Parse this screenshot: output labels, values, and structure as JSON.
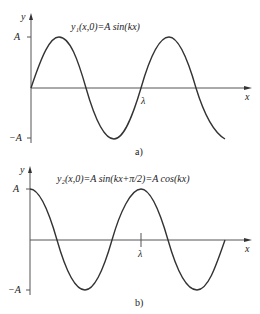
{
  "figure_a": {
    "equation": "y₁(x,0)=A sin(kx)",
    "y_axis_label": "y",
    "x_axis_label": "x",
    "tick_A": "A",
    "tick_negA": "−A",
    "lambda_label": "λ",
    "panel_label": "a)"
  },
  "figure_b": {
    "equation": "y₂(x,0)=A sin(kx+π/2)=A cos(kx)",
    "y_axis_label": "y",
    "x_axis_label": "x",
    "tick_A": "A",
    "tick_negA": "−A",
    "lambda_label": "λ",
    "panel_label": "b)"
  },
  "colors": {
    "stroke": "#333333",
    "axis": "#555555"
  }
}
